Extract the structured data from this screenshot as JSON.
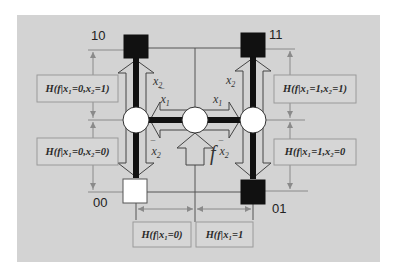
{
  "diagram": {
    "title": "",
    "background_color": "#d3d3d3",
    "nodes": [
      {
        "id": "10",
        "label": "10",
        "fill": "#111111",
        "position": "top-left"
      },
      {
        "id": "11",
        "label": "11",
        "fill": "#111111",
        "position": "top-right"
      },
      {
        "id": "00",
        "label": "00",
        "fill": "#ffffff",
        "position": "bottom-left"
      },
      {
        "id": "01",
        "label": "01",
        "fill": "#111111",
        "position": "bottom-right"
      }
    ],
    "junctions": [
      {
        "id": "left-circle"
      },
      {
        "id": "center-circle"
      },
      {
        "id": "right-circle"
      }
    ],
    "arrow_labels": {
      "left_up": "x",
      "left_up_sub": "2",
      "left_down": "x",
      "left_down_sub": "2",
      "left_down_bar": "¯",
      "right_up": "x",
      "right_up_sub": "2",
      "right_down": "x",
      "right_down_sub": "2",
      "right_down_bar": "¯",
      "center_left": "x",
      "center_left_sub": "1",
      "center_left_bar": "¯",
      "center_right": "x",
      "center_right_sub": "1",
      "input": "f"
    },
    "entropy_boxes": {
      "left_top": "H(f|x₁=0,x₂=1)",
      "left_bottom": "H(f|x₁=0,x₂=0)",
      "right_top": "H(f|x₁=1,x₂=1)",
      "right_bottom": "H(f|x₁=1,x₂=0",
      "bottom_left": "H(f|x₁=0)",
      "bottom_right": "H(f|x₁=1"
    }
  }
}
